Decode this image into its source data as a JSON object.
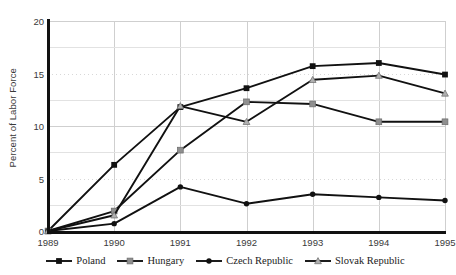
{
  "chart_data": {
    "type": "line",
    "title": "",
    "xlabel": "",
    "ylabel": "Percent of Labor Force",
    "x": [
      1989,
      1990,
      1991,
      1992,
      1993,
      1994,
      1995
    ],
    "xticklabels": [
      "1989",
      "1990",
      "1991",
      "1992",
      "1993",
      "1994",
      "1995"
    ],
    "yticklabels": [
      "0",
      "5",
      "10",
      "15",
      "20"
    ],
    "yticks": [
      0,
      5,
      10,
      15,
      20
    ],
    "ylim": [
      0,
      20
    ],
    "xlim": [
      1989,
      1995
    ],
    "grid": true,
    "legend_position": "bottom",
    "series": [
      {
        "name": "Poland",
        "marker": "filled-square",
        "color": "#111111",
        "values": [
          0.0,
          6.3,
          11.8,
          13.6,
          15.7,
          16.0,
          14.9
        ]
      },
      {
        "name": "Hungary",
        "marker": "light-square",
        "color": "#111111",
        "marker_color": "#8f8f8f",
        "values": [
          0.0,
          1.9,
          7.7,
          12.3,
          12.1,
          10.4,
          10.4
        ]
      },
      {
        "name": "Czech Republic",
        "marker": "filled-circle",
        "color": "#111111",
        "values": [
          0.0,
          0.7,
          4.2,
          2.6,
          3.5,
          3.2,
          2.9
        ]
      },
      {
        "name": "Slovak Republic",
        "marker": "light-triangle",
        "color": "#111111",
        "marker_color": "#b0b0b0",
        "values": [
          0.0,
          1.5,
          11.9,
          10.4,
          14.4,
          14.8,
          13.1
        ]
      }
    ]
  },
  "legend": {
    "items": [
      {
        "label": "Poland"
      },
      {
        "label": "Hungary"
      },
      {
        "label": "Czech Republic"
      },
      {
        "label": "Slovak Republic"
      }
    ]
  },
  "axes": {
    "y_title": "Percent of Labor Force"
  },
  "colors": {
    "line": "#111111",
    "grid": "#cfcfcf",
    "axis": "#111111",
    "text": "#3a3a3a"
  }
}
